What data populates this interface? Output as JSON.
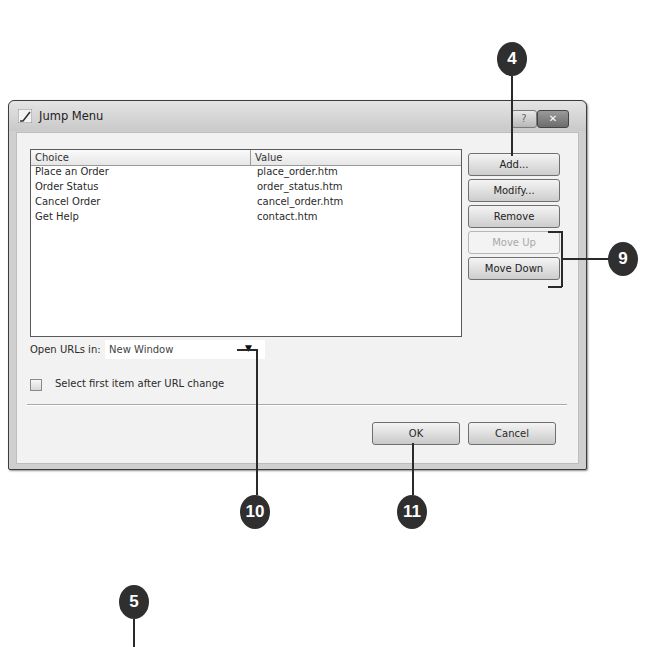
{
  "dialog": {
    "title": "Jump Menu",
    "help_button": "?",
    "close_button": "✕",
    "list": {
      "columns": [
        "Choice",
        "Value"
      ],
      "rows": [
        {
          "choice": "Place an Order",
          "value": "place_order.htm"
        },
        {
          "choice": "Order Status",
          "value": "order_status.htm"
        },
        {
          "choice": "Cancel Order",
          "value": "cancel_order.htm"
        },
        {
          "choice": "Get Help",
          "value": "contact.htm"
        }
      ]
    },
    "side_buttons": {
      "add": "Add...",
      "modify": "Modify...",
      "remove": "Remove",
      "move_up": "Move Up",
      "move_down": "Move Down"
    },
    "open_urls_label": "Open URLs in:",
    "open_urls_value": "New Window",
    "dropdown_arrow": "▼",
    "select_first_label": "Select first item after URL change",
    "select_first_checked": false,
    "ok": "OK",
    "cancel": "Cancel"
  },
  "callouts": {
    "c4": "4",
    "c5": "5",
    "c9": "9",
    "c10": "10",
    "c11": "11"
  }
}
